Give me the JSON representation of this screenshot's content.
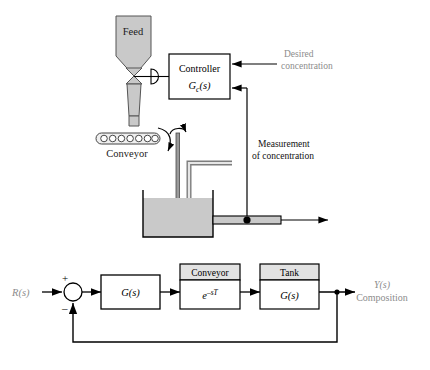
{
  "figure": {
    "background_color": "#ffffff",
    "line_color": "#000000",
    "gray_text_color": "#8c8c8c",
    "fill_gray": "#c9c9c9",
    "header_gray": "#e2e2e2"
  },
  "process_schematic": {
    "hopper_label": "Feed",
    "controller": {
      "title": "Controller",
      "transfer_function": "G",
      "subscript": "c",
      "argument": "(s)"
    },
    "desired_concentration_label_line1": "Desired",
    "desired_concentration_label_line2": "concentration",
    "measurement_label_line1": "Measurement",
    "measurement_label_line2": "of concentration",
    "conveyor_label": "Conveyor",
    "conveyor_roller_count": 7
  },
  "block_diagram": {
    "input_label": "R(s)",
    "sum_plus": "+",
    "sum_minus": "–",
    "blocks": [
      {
        "name": "plant-controller",
        "header": "",
        "body": "G(s)"
      },
      {
        "name": "conveyor",
        "header": "Conveyor",
        "body_base": "e",
        "body_exp": "–sT"
      },
      {
        "name": "tank",
        "header": "Tank",
        "body": "G(s)"
      }
    ],
    "output_label_line1": "Y(s)",
    "output_label_line2": "Composition"
  }
}
